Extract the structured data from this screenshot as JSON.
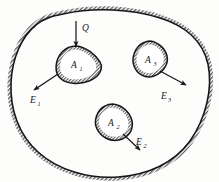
{
  "figure": {
    "type": "physics-diagram",
    "colors": {
      "ink": "#17171a",
      "hatch": "#6f6f72",
      "background": "#fdfdfc",
      "fill": "#ffffff"
    },
    "outer_region": {
      "name": "outer-boundary",
      "hatch_side": "outside",
      "line_width": 1.6,
      "hatch_band_width": 7
    },
    "inner_regions": [
      {
        "id": "A1",
        "label": "A",
        "subscript": "1",
        "label_x": 76,
        "label_y": 66,
        "center_x": 76,
        "center_y": 64,
        "shape": "rounded-triangle",
        "hatch_side": "inside"
      },
      {
        "id": "A2",
        "label": "A",
        "subscript": "2",
        "label_x": 113,
        "label_y": 124,
        "center_x": 113,
        "center_y": 122,
        "shape": "rounded-triangle",
        "hatch_side": "inside"
      },
      {
        "id": "A3",
        "label": "A",
        "subscript": "3",
        "label_x": 150,
        "label_y": 61,
        "center_x": 150,
        "center_y": 59,
        "shape": "rounded-triangle",
        "hatch_side": "inside"
      }
    ],
    "arrows": [
      {
        "id": "Q",
        "label": "Q",
        "subscript": "",
        "label_x": 83,
        "label_y": 29,
        "x1": 76,
        "y1": 21,
        "x2": 76,
        "y2": 47,
        "direction": "down",
        "meaning": "incoming-source"
      },
      {
        "id": "E1",
        "label": "E",
        "subscript": "1",
        "label_x": 35,
        "label_y": 100,
        "x1": 58,
        "y1": 74,
        "x2": 33,
        "y2": 90,
        "direction": "down-left",
        "meaning": "outgoing-field"
      },
      {
        "id": "E2",
        "label": "E",
        "subscript": "2",
        "label_x": 140,
        "label_y": 146,
        "x1": 123,
        "y1": 133,
        "x2": 141,
        "y2": 150,
        "direction": "down-right",
        "meaning": "outgoing-field"
      },
      {
        "id": "E3",
        "label": "E",
        "subscript": "3",
        "label_x": 165,
        "label_y": 96,
        "x1": 158,
        "y1": 70,
        "x2": 185,
        "y2": 84,
        "direction": "down-right",
        "meaning": "outgoing-field"
      }
    ]
  }
}
